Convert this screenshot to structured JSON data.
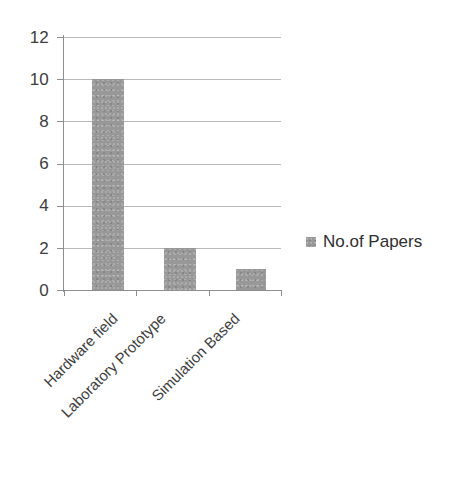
{
  "chart_data": {
    "type": "bar",
    "title": "",
    "subtitle": "",
    "xlabel": "",
    "ylabel": "",
    "categories": [
      "Hardware field",
      "Laboratory Prototype",
      "Simulation Based"
    ],
    "series": [
      {
        "name": "No.of Papers",
        "values": [
          10,
          2,
          1
        ],
        "color": "#989898"
      }
    ],
    "ylim": [
      0,
      12
    ],
    "ytick_labels": [
      "0",
      "2",
      "4",
      "6",
      "8",
      "10",
      "12"
    ],
    "ytick_values": [
      0,
      2,
      4,
      6,
      8,
      10,
      12
    ],
    "grid": "horizontal",
    "legend_position": "right",
    "legend_entries": [
      "No.of Papers"
    ],
    "annotations": [],
    "category_label_rotation": -45,
    "background_color": "#ffffff",
    "gridline_color": "#b9b9b9",
    "axis_color": "#8e8e8e",
    "text_color": "#3d3d3d"
  }
}
